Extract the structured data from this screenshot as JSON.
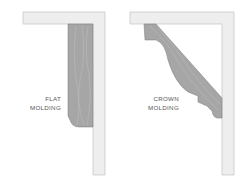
{
  "panels": [
    {
      "id": "flat",
      "label_lines": [
        "FLAT",
        "MOLDING"
      ]
    },
    {
      "id": "crown",
      "label_lines": [
        "CROWN",
        "MOLDING"
      ]
    }
  ],
  "colors": {
    "board": "#eeeeee",
    "board_edge": "#b8b8b8",
    "molding": "#a6a6a6",
    "molding_edge": "#7a7a7a",
    "grain": "#c4c4c4"
  }
}
